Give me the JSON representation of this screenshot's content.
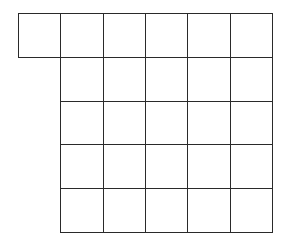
{
  "diagram": {
    "type": "grid-shape",
    "line_color": "#2a2a2a",
    "background": "#ffffff",
    "origin": [
      18,
      13
    ],
    "cell_width": 42.33,
    "cell_height": 43.8,
    "rows": [
      {
        "start_col": 0,
        "count": 6
      },
      {
        "start_col": 1,
        "count": 5
      },
      {
        "start_col": 1,
        "count": 5
      },
      {
        "start_col": 1,
        "count": 5
      },
      {
        "start_col": 1,
        "count": 5
      }
    ],
    "total_squares": 26
  }
}
